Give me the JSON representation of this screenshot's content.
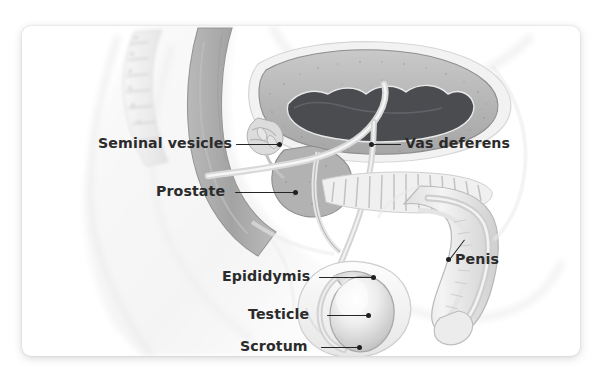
{
  "illustration": {
    "title": "Male reproductive system sagittal section",
    "style": "grayscale medical illustration",
    "background_color": "#ffffff",
    "card_color": "#ffffff",
    "label_color": "#2b2b2b",
    "leader_color": "#222426"
  },
  "labels": [
    {
      "id": "seminal-vesicles",
      "text": "Seminal vesicles",
      "side": "left"
    },
    {
      "id": "prostate",
      "text": "Prostate",
      "side": "left"
    },
    {
      "id": "epididymis",
      "text": "Epididymis",
      "side": "left"
    },
    {
      "id": "testicle",
      "text": "Testicle",
      "side": "left"
    },
    {
      "id": "scrotum",
      "text": "Scrotum",
      "side": "left"
    },
    {
      "id": "vas-deferens",
      "text": "Vas deferens",
      "side": "right"
    },
    {
      "id": "penis",
      "text": "Penis",
      "side": "right"
    }
  ]
}
